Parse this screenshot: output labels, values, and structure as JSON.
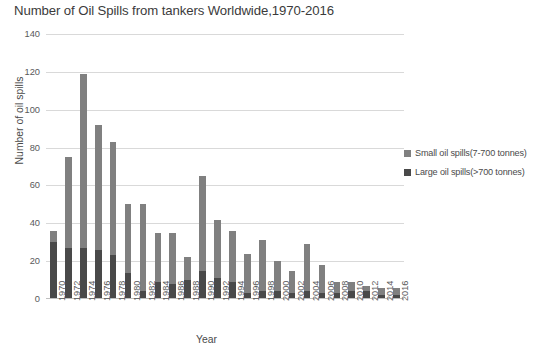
{
  "chart_data": {
    "type": "bar",
    "title": "Number of Oil Spills from tankers Worldwide,1970-2016",
    "xlabel": "Year",
    "ylabel": "Number of oil spills",
    "ylim": [
      0,
      140
    ],
    "ytick_step": 20,
    "yticks": [
      0,
      20,
      40,
      60,
      80,
      100,
      120,
      140
    ],
    "grid": true,
    "stacked": true,
    "legend_position": "right",
    "categories": [
      "1970",
      "1972",
      "1974",
      "1976",
      "1978",
      "1980",
      "1982",
      "1984",
      "1986",
      "1988",
      "1990",
      "1992",
      "1994",
      "1996",
      "1998",
      "2000",
      "2002",
      "2004",
      "2006",
      "2008",
      "2010",
      "2012",
      "2014",
      "2016"
    ],
    "series": [
      {
        "name": "Large oil spills(>700 tonnes)",
        "color": "#494949",
        "values": [
          30,
          27,
          27,
          26,
          23,
          14,
          4,
          9,
          8,
          10,
          15,
          11,
          9,
          3,
          4,
          4,
          3,
          4,
          3,
          3,
          4,
          4,
          2,
          2
        ]
      },
      {
        "name": "Small oil spills(7-700 tonnes)",
        "color": "#808080",
        "values": [
          6,
          48,
          92,
          66,
          60,
          36,
          46,
          26,
          27,
          12,
          50,
          31,
          27,
          21,
          27,
          16,
          12,
          25,
          15,
          6,
          5,
          3,
          4,
          4
        ]
      }
    ],
    "totals": [
      36,
      75,
      119,
      92,
      83,
      50,
      50,
      35,
      35,
      22,
      65,
      42,
      36,
      24,
      31,
      20,
      15,
      29,
      18,
      9,
      9,
      7,
      6,
      6
    ]
  },
  "legend": {
    "entries": [
      {
        "label": "Small oil spills(7-700 tonnes)",
        "color": "#808080"
      },
      {
        "label": "Large oil spills(>700 tonnes)",
        "color": "#494949"
      }
    ]
  }
}
